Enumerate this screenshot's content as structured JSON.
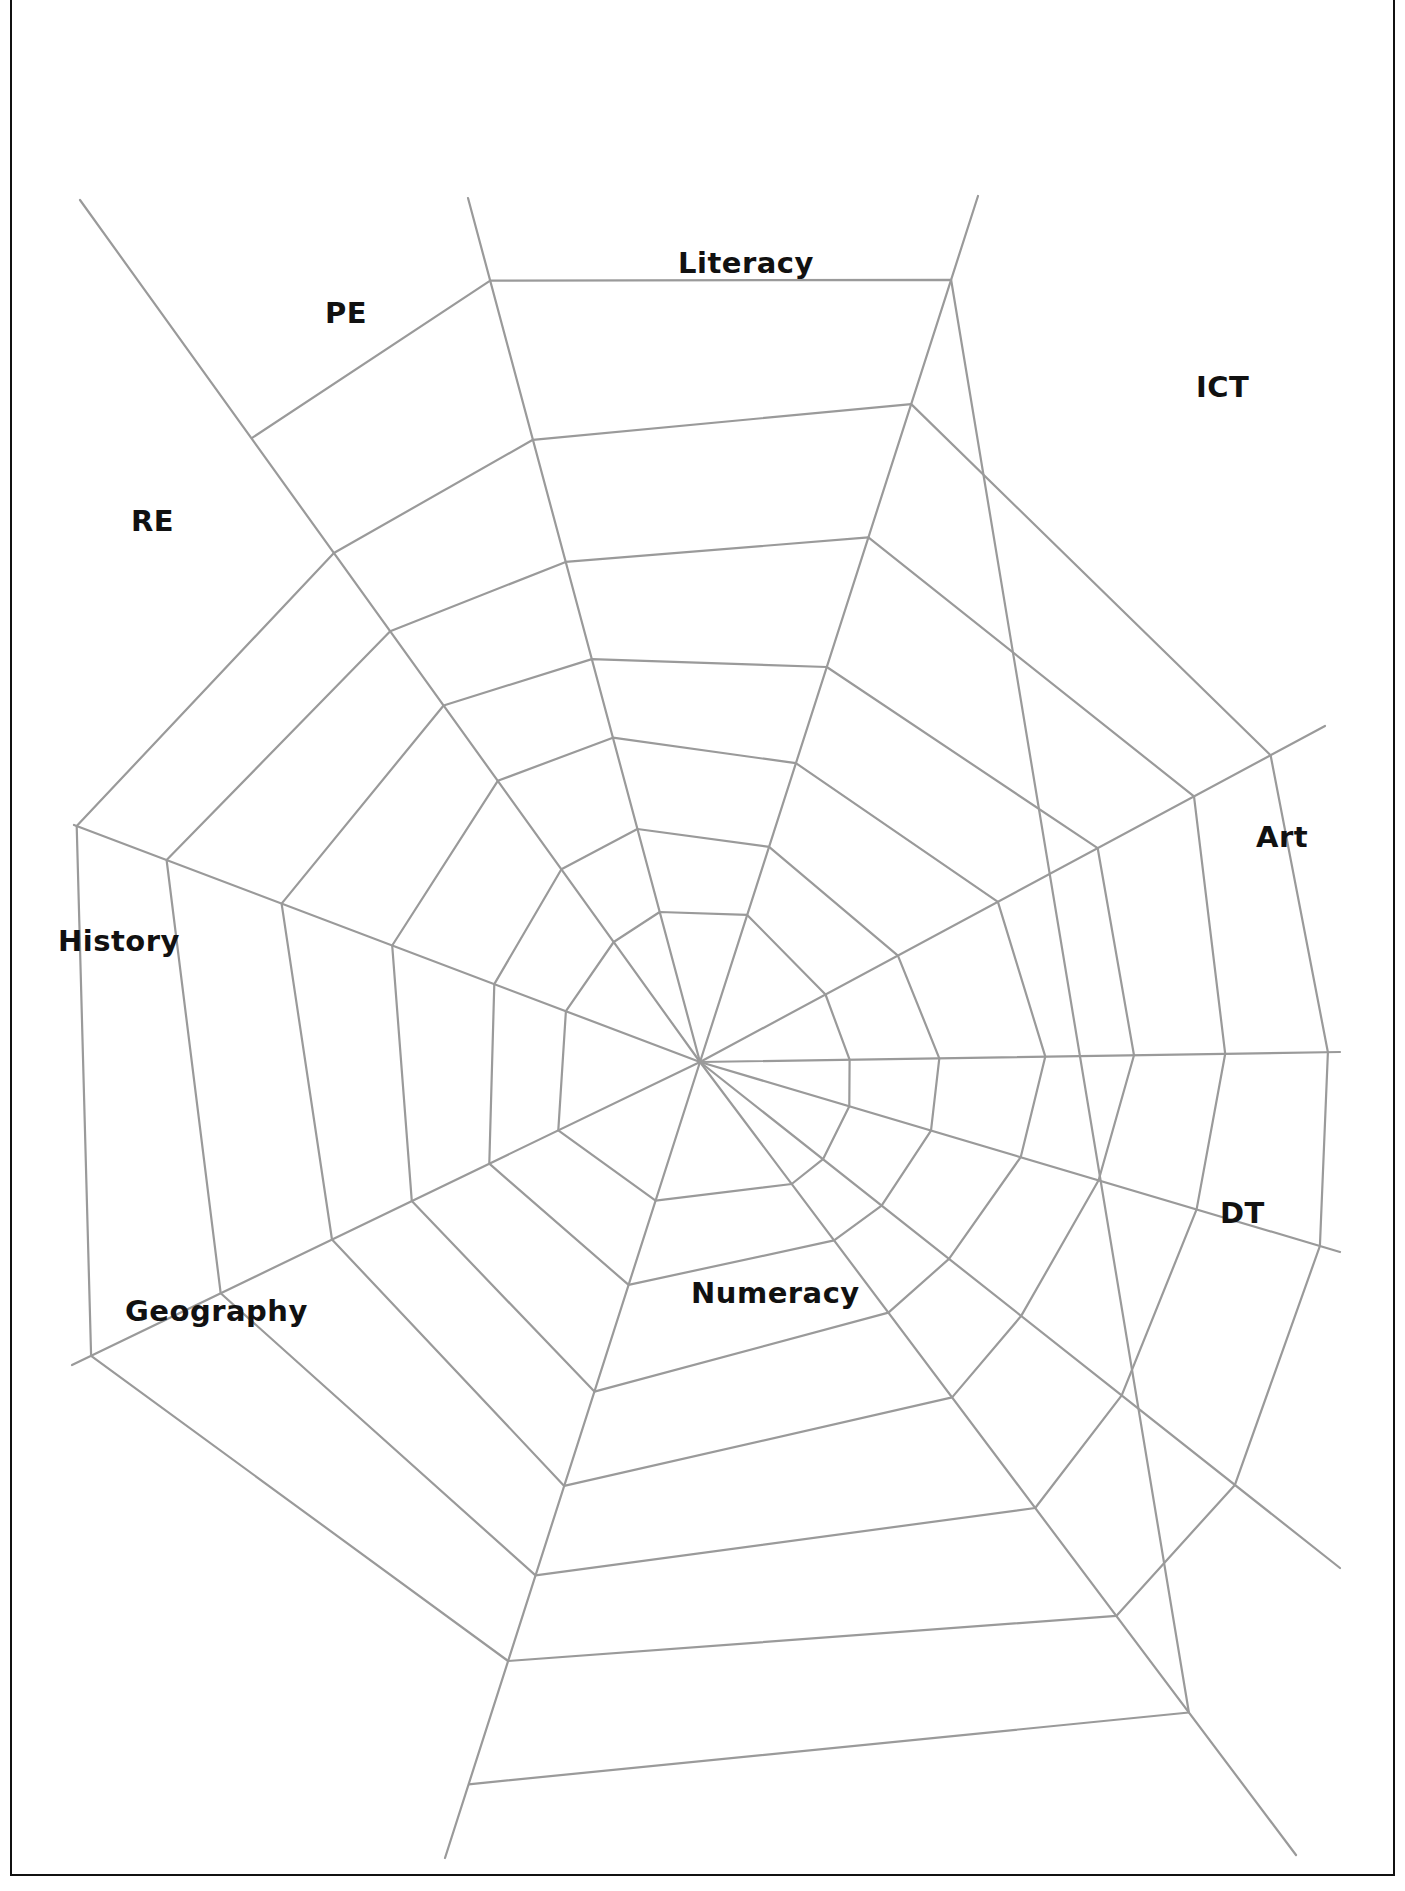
{
  "diagram": {
    "type": "spider-web",
    "center": [
      700,
      1062
    ],
    "line_color": "#9a9a9a",
    "labels": [
      {
        "text": "Literacy",
        "x": 678,
        "y": 272
      },
      {
        "text": "PE",
        "x": 325,
        "y": 322
      },
      {
        "text": "ICT",
        "x": 1196,
        "y": 396
      },
      {
        "text": "RE",
        "x": 131,
        "y": 530
      },
      {
        "text": "Art",
        "x": 1256,
        "y": 846
      },
      {
        "text": "History",
        "x": 58,
        "y": 950
      },
      {
        "text": "DT",
        "x": 1220,
        "y": 1222
      },
      {
        "text": "Geography",
        "x": 125,
        "y": 1320
      },
      {
        "text": "Numeracy",
        "x": 691,
        "y": 1302
      }
    ],
    "spokes": [
      [
        [
          700,
          1062
        ],
        [
          468,
          198
        ]
      ],
      [
        [
          700,
          1062
        ],
        [
          978,
          196
        ]
      ],
      [
        [
          700,
          1062
        ],
        [
          1325,
          726
        ]
      ],
      [
        [
          700,
          1062
        ],
        [
          1340,
          1052
        ]
      ],
      [
        [
          700,
          1062
        ],
        [
          1340,
          1252
        ]
      ],
      [
        [
          700,
          1062
        ],
        [
          1340,
          1568
        ]
      ],
      [
        [
          700,
          1062
        ],
        [
          1296,
          1855
        ]
      ],
      [
        [
          700,
          1062
        ],
        [
          445,
          1858
        ]
      ],
      [
        [
          700,
          1062
        ],
        [
          72,
          1365
        ]
      ],
      [
        [
          700,
          1062
        ],
        [
          74,
          825
        ]
      ],
      [
        [
          700,
          1062
        ],
        [
          80,
          200
        ]
      ]
    ],
    "rings": [
      [
        [
          522,
          938
        ],
        [
          540,
          924
        ],
        [
          645,
          925
        ],
        [
          666,
          938
        ],
        [
          710,
          1000
        ],
        [
          744,
          1018
        ],
        [
          872,
          1075
        ],
        [
          853,
          1104
        ],
        [
          848,
          1137
        ],
        [
          820,
          1180
        ],
        [
          780,
          1200
        ],
        [
          648,
          1218
        ],
        [
          583,
          1117
        ],
        [
          536,
          1150
        ],
        [
          536,
          1022
        ]
      ],
      [
        [
          580,
          855
        ],
        [
          620,
          828
        ],
        [
          782,
          825
        ],
        [
          830,
          884
        ],
        [
          920,
          960
        ],
        [
          947,
          1068
        ],
        [
          930,
          1135
        ],
        [
          870,
          1212
        ],
        [
          788,
          1222
        ],
        [
          625,
          1258
        ],
        [
          618,
          1265
        ],
        [
          575,
          1240
        ],
        [
          497,
          1170
        ],
        [
          462,
          1098
        ],
        [
          464,
          1020
        ],
        [
          492,
          970
        ],
        [
          553,
          932
        ]
      ],
      [
        [
          545,
          772
        ],
        [
          597,
          735
        ],
        [
          810,
          728
        ],
        [
          897,
          769
        ],
        [
          1033,
          898
        ],
        [
          1058,
          1064
        ],
        [
          1042,
          1158
        ],
        [
          1000,
          1232
        ],
        [
          968,
          1265
        ],
        [
          883,
          1268
        ],
        [
          601,
          1303
        ],
        [
          542,
          1237
        ],
        [
          443,
          1140
        ],
        [
          409,
          1098
        ],
        [
          397,
          1000
        ],
        [
          440,
          919
        ]
      ],
      [
        [
          478,
          683
        ],
        [
          574,
          637
        ],
        [
          850,
          625
        ],
        [
          1035,
          770
        ],
        [
          1133,
          826
        ],
        [
          1132,
          1059
        ],
        [
          1110,
          1198
        ],
        [
          1075,
          1277
        ],
        [
          1025,
          1337
        ],
        [
          940,
          1365
        ],
        [
          562,
          1367
        ],
        [
          494,
          1303
        ],
        [
          334,
          1200
        ],
        [
          314,
          1093
        ],
        [
          300,
          946
        ]
      ],
      [
        [
          382,
          579
        ],
        [
          549,
          513
        ],
        [
          888,
          507
        ],
        [
          1132,
          712
        ],
        [
          1134,
          822
        ],
        [
          1140,
          1058
        ],
        [
          1114,
          1206
        ],
        [
          1099,
          1237
        ],
        [
          1060,
          1290
        ],
        [
          1020,
          1370
        ],
        [
          1022,
          1507
        ],
        [
          1144,
          1393
        ]
      ],
      [
        [
          317,
          468
        ],
        [
          523,
          380
        ],
        [
          935,
          382
        ],
        [
          1110,
          526
        ],
        [
          1245,
          647
        ],
        [
          1240,
          833
        ],
        [
          1222,
          1055
        ],
        [
          1196,
          1216
        ],
        [
          1150,
          1390
        ],
        [
          1122,
          1478
        ],
        [
          1080,
          1570
        ],
        [
          574,
          1535
        ],
        [
          476,
          1479
        ],
        [
          289,
          1275
        ],
        [
          232,
          948
        ],
        [
          172,
          832
        ]
      ],
      [
        [
          294,
          487
        ],
        [
          521,
          379
        ],
        [
          750,
          378
        ],
        [
          938,
          381
        ]
      ],
      [
        [
          243,
          1276
        ],
        [
          289,
          1275
        ],
        [
          400,
          1237
        ],
        [
          572,
          1130
        ]
      ],
      [
        [
          561,
          1524
        ],
        [
          574,
          1535
        ],
        [
          1028,
          1500
        ],
        [
          1118,
          1480
        ]
      ]
    ]
  }
}
